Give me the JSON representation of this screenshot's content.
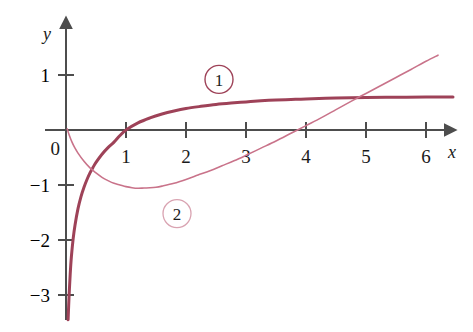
{
  "figure": {
    "background_color": "#ffffff",
    "axis_color": "#4d4d4d",
    "text_color": "#1a1a1a"
  },
  "axes": {
    "x_axis_name": "x",
    "y_axis_name": "y",
    "origin_label": "0",
    "x_ticks": [
      "1",
      "2",
      "3",
      "4",
      "5",
      "6"
    ],
    "y_ticks": [
      "1",
      "−1",
      "−2",
      "−3"
    ]
  },
  "chart_data": {
    "type": "line",
    "title": "",
    "xlabel": "x",
    "ylabel": "y",
    "xlim": [
      -0.35,
      6.75
    ],
    "ylim": [
      -3.45,
      1.35
    ],
    "xticks": [
      1,
      2,
      3,
      4,
      5,
      6
    ],
    "yticks": [
      1,
      -1,
      -2,
      -3
    ],
    "grid": false,
    "legend": "inline-circled-labels",
    "origin_label": "0",
    "series": [
      {
        "name": "1",
        "label": "1",
        "color": "#9e4258",
        "linewidth": 3.0,
        "label_position": {
          "x": 2.55,
          "y": 0.92
        },
        "notes": "Increasing concave-down curve with vertical asymptote at x=0; passes through (1,0); saturates near y=0.60",
        "x": [
          0.035,
          0.05,
          0.07,
          0.09,
          0.12,
          0.15,
          0.2,
          0.25,
          0.3,
          0.35,
          0.4,
          0.45,
          0.5,
          0.6,
          0.7,
          0.8,
          0.9,
          1.0,
          1.2,
          1.4,
          1.6,
          1.8,
          2.0,
          2.25,
          2.5,
          2.75,
          3.0,
          3.25,
          3.5,
          3.75,
          4.0,
          4.5,
          5.0,
          5.5,
          6.0,
          6.45
        ],
        "y": [
          -3.45,
          -3.05,
          -2.62,
          -2.3,
          -1.97,
          -1.73,
          -1.43,
          -1.21,
          -1.04,
          -0.9,
          -0.78,
          -0.68,
          -0.59,
          -0.44,
          -0.32,
          -0.22,
          -0.1,
          0.0,
          0.13,
          0.22,
          0.29,
          0.345,
          0.39,
          0.43,
          0.465,
          0.49,
          0.51,
          0.53,
          0.545,
          0.555,
          0.565,
          0.58,
          0.59,
          0.595,
          0.6,
          0.6
        ]
      },
      {
        "name": "2",
        "label": "2",
        "color": "#c9738a",
        "linewidth": 1.6,
        "label_position": {
          "x": 1.85,
          "y": -1.52
        },
        "notes": "Starts near (0,0), decreases to a minimum of about -1.05 near x=1.2, then increases; crosses y=0 near x=4 and crosses curve 1 near x=5",
        "x": [
          0.02,
          0.05,
          0.1,
          0.15,
          0.2,
          0.3,
          0.4,
          0.5,
          0.6,
          0.7,
          0.8,
          0.9,
          1.0,
          1.1,
          1.2,
          1.3,
          1.4,
          1.5,
          1.6,
          1.8,
          2.0,
          2.2,
          2.4,
          2.6,
          2.8,
          3.0,
          3.25,
          3.5,
          3.75,
          4.0,
          4.25,
          4.5,
          4.75,
          5.0,
          5.25,
          5.5,
          5.75,
          6.0,
          6.2
        ],
        "y": [
          0.02,
          -0.08,
          -0.22,
          -0.33,
          -0.42,
          -0.57,
          -0.69,
          -0.78,
          -0.86,
          -0.92,
          -0.97,
          -1.0,
          -1.03,
          -1.05,
          -1.06,
          -1.055,
          -1.05,
          -1.04,
          -1.02,
          -0.97,
          -0.9,
          -0.82,
          -0.74,
          -0.65,
          -0.56,
          -0.46,
          -0.33,
          -0.2,
          -0.06,
          0.08,
          0.22,
          0.37,
          0.52,
          0.665,
          0.81,
          0.955,
          1.1,
          1.25,
          1.36
        ]
      }
    ]
  }
}
